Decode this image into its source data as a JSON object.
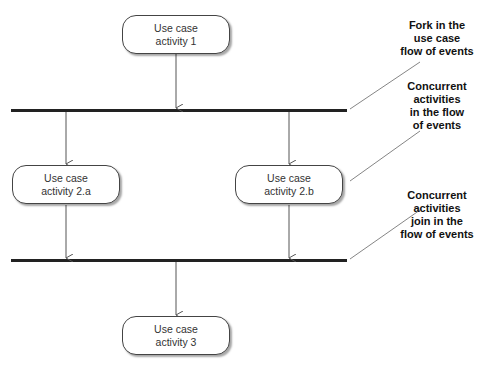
{
  "diagram": {
    "type": "UML activity diagram",
    "nodes": [
      {
        "id": "activity-1",
        "line1": "Use case",
        "line2": "activity 1"
      },
      {
        "id": "activity-2a",
        "line1": "Use case",
        "line2": "activity 2.a"
      },
      {
        "id": "activity-2b",
        "line1": "Use case",
        "line2": "activity 2.b"
      },
      {
        "id": "activity-3",
        "line1": "Use case",
        "line2": "activity 3"
      }
    ],
    "bars": [
      {
        "id": "fork-bar",
        "kind": "fork"
      },
      {
        "id": "join-bar",
        "kind": "join"
      }
    ],
    "annotations": [
      {
        "id": "fork-note",
        "lines": [
          "Fork in the",
          "use case",
          "flow of events"
        ]
      },
      {
        "id": "concurrent-note",
        "lines": [
          "Concurrent",
          "activities",
          "in the flow",
          "of events"
        ]
      },
      {
        "id": "join-note",
        "lines": [
          "Concurrent",
          "activities",
          "join in the",
          "flow of events"
        ]
      }
    ],
    "colors": {
      "line": "#555555",
      "bar": "#222222",
      "node_border": "#444444",
      "text": "#333333"
    }
  }
}
